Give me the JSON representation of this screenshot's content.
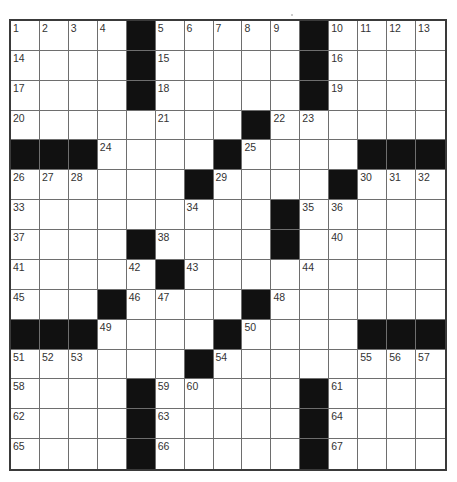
{
  "puzzle": {
    "size": {
      "rows": 15,
      "cols": 15
    },
    "colors": {
      "black_square": "#111111",
      "white_square": "#ffffff",
      "grid_line": "#6e6e6e",
      "number_text": "#333333"
    },
    "layout": [
      ".....#.....#....",
      "placeholder"
    ],
    "rows": [
      "....#.....#....",
      "....#.....#....",
      "....#.....#....",
      "........#......",
      "###....#....###",
      "......#....#...",
      ".........#.....",
      "....#....#.....",
      ".....#.........",
      "...#....#......",
      "###....#....###",
      "......#........",
      "....#.....#....",
      "....#.....#....",
      "....#.....#...."
    ],
    "numbers": [
      {
        "r": 0,
        "c": 0,
        "n": "1"
      },
      {
        "r": 0,
        "c": 1,
        "n": "2"
      },
      {
        "r": 0,
        "c": 2,
        "n": "3"
      },
      {
        "r": 0,
        "c": 3,
        "n": "4"
      },
      {
        "r": 0,
        "c": 5,
        "n": "5"
      },
      {
        "r": 0,
        "c": 6,
        "n": "6"
      },
      {
        "r": 0,
        "c": 7,
        "n": "7"
      },
      {
        "r": 0,
        "c": 8,
        "n": "8"
      },
      {
        "r": 0,
        "c": 9,
        "n": "9"
      },
      {
        "r": 0,
        "c": 11,
        "n": "10"
      },
      {
        "r": 0,
        "c": 12,
        "n": "11"
      },
      {
        "r": 0,
        "c": 13,
        "n": "12"
      },
      {
        "r": 0,
        "c": 14,
        "n": "13"
      },
      {
        "r": 1,
        "c": 0,
        "n": "14"
      },
      {
        "r": 1,
        "c": 5,
        "n": "15"
      },
      {
        "r": 1,
        "c": 11,
        "n": "16"
      },
      {
        "r": 2,
        "c": 0,
        "n": "17"
      },
      {
        "r": 2,
        "c": 5,
        "n": "18"
      },
      {
        "r": 2,
        "c": 11,
        "n": "19"
      },
      {
        "r": 3,
        "c": 0,
        "n": "20"
      },
      {
        "r": 3,
        "c": 5,
        "n": "21"
      },
      {
        "r": 3,
        "c": 9,
        "n": "22"
      },
      {
        "r": 3,
        "c": 10,
        "n": "23"
      },
      {
        "r": 4,
        "c": 3,
        "n": "24"
      },
      {
        "r": 4,
        "c": 8,
        "n": "25"
      },
      {
        "r": 5,
        "c": 0,
        "n": "26"
      },
      {
        "r": 5,
        "c": 1,
        "n": "27"
      },
      {
        "r": 5,
        "c": 2,
        "n": "28"
      },
      {
        "r": 5,
        "c": 7,
        "n": "29"
      },
      {
        "r": 5,
        "c": 12,
        "n": "30"
      },
      {
        "r": 5,
        "c": 13,
        "n": "31"
      },
      {
        "r": 5,
        "c": 14,
        "n": "32"
      },
      {
        "r": 6,
        "c": 0,
        "n": "33"
      },
      {
        "r": 6,
        "c": 6,
        "n": "34"
      },
      {
        "r": 6,
        "c": 10,
        "n": "35"
      },
      {
        "r": 6,
        "c": 11,
        "n": "36"
      },
      {
        "r": 7,
        "c": 0,
        "n": "37"
      },
      {
        "r": 7,
        "c": 5,
        "n": "38"
      },
      {
        "r": 7,
        "c": 9,
        "n": "39"
      },
      {
        "r": 7,
        "c": 11,
        "n": "40"
      },
      {
        "r": 8,
        "c": 0,
        "n": "41"
      },
      {
        "r": 8,
        "c": 4,
        "n": "42"
      },
      {
        "r": 8,
        "c": 6,
        "n": "43"
      },
      {
        "r": 8,
        "c": 10,
        "n": "44"
      },
      {
        "r": 9,
        "c": 0,
        "n": "45"
      },
      {
        "r": 9,
        "c": 4,
        "n": "46"
      },
      {
        "r": 9,
        "c": 5,
        "n": "47"
      },
      {
        "r": 9,
        "c": 9,
        "n": "48"
      },
      {
        "r": 10,
        "c": 3,
        "n": "49"
      },
      {
        "r": 10,
        "c": 8,
        "n": "50"
      },
      {
        "r": 11,
        "c": 0,
        "n": "51"
      },
      {
        "r": 11,
        "c": 1,
        "n": "52"
      },
      {
        "r": 11,
        "c": 2,
        "n": "53"
      },
      {
        "r": 11,
        "c": 7,
        "n": "54"
      },
      {
        "r": 11,
        "c": 12,
        "n": "55"
      },
      {
        "r": 11,
        "c": 13,
        "n": "56"
      },
      {
        "r": 11,
        "c": 14,
        "n": "57"
      },
      {
        "r": 12,
        "c": 0,
        "n": "58"
      },
      {
        "r": 12,
        "c": 5,
        "n": "59"
      },
      {
        "r": 12,
        "c": 6,
        "n": "60"
      },
      {
        "r": 12,
        "c": 11,
        "n": "61"
      },
      {
        "r": 13,
        "c": 0,
        "n": "62"
      },
      {
        "r": 13,
        "c": 5,
        "n": "63"
      },
      {
        "r": 13,
        "c": 11,
        "n": "64"
      },
      {
        "r": 14,
        "c": 0,
        "n": "65"
      },
      {
        "r": 14,
        "c": 5,
        "n": "66"
      },
      {
        "r": 14,
        "c": 11,
        "n": "67"
      }
    ]
  }
}
